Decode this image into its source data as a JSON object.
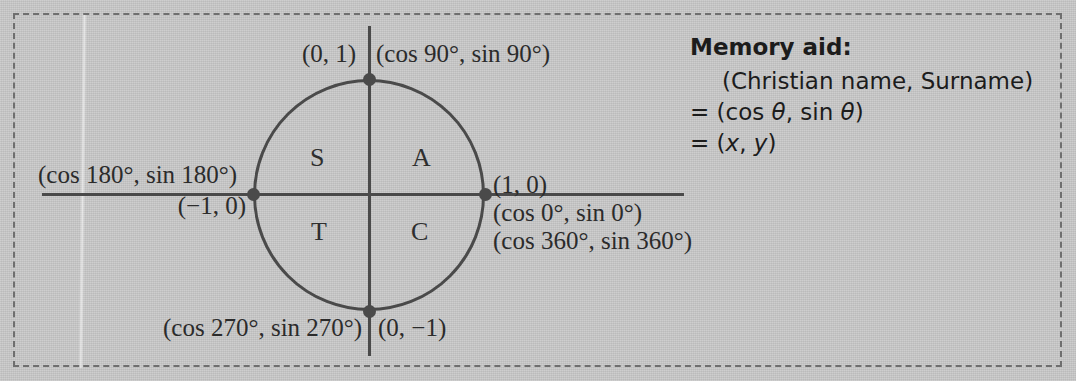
{
  "figure": {
    "type": "unit-circle-diagram",
    "background_color": "#cacaca",
    "ink_color": "#3d3d3d",
    "border_style": "dashed"
  },
  "diagram": {
    "quadrant_letters": {
      "quadrant_1": "A",
      "quadrant_2": "S",
      "quadrant_3": "T",
      "quadrant_4": "C"
    },
    "labels": {
      "top_cartesian": "(0, 1)",
      "top_trig": "(cos 90°, sin 90°)",
      "left_trig": "(cos 180°, sin 180°)",
      "left_cartesian": "(−1, 0)",
      "right_cartesian": "(1, 0)",
      "right_trig_0": "(cos 0°, sin 0°)",
      "right_trig_360": "(cos 360°, sin 360°)",
      "bottom_trig": "(cos 270°, sin 270°)",
      "bottom_cartesian": "(0, −1)"
    },
    "points": [
      {
        "name": "point-90",
        "cartesian": "(0, 1)",
        "angle_degrees": 90
      },
      {
        "name": "point-180",
        "cartesian": "(−1, 0)",
        "angle_degrees": 180
      },
      {
        "name": "point-0-360",
        "cartesian": "(1, 0)",
        "angle_degrees": 0
      },
      {
        "name": "point-270",
        "cartesian": "(0, −1)",
        "angle_degrees": 270
      }
    ]
  },
  "memory_aid": {
    "title": "Memory aid:",
    "line_1": "(Christian name, Surname)",
    "line_2_prefix": "= (cos ",
    "line_2_theta": "θ",
    "line_2_middle": ", sin ",
    "line_2_theta2": "θ",
    "line_2_suffix": ")",
    "line_3_prefix": "= (",
    "line_3_x": "x",
    "line_3_comma": ", ",
    "line_3_y": "y",
    "line_3_suffix": ")"
  }
}
